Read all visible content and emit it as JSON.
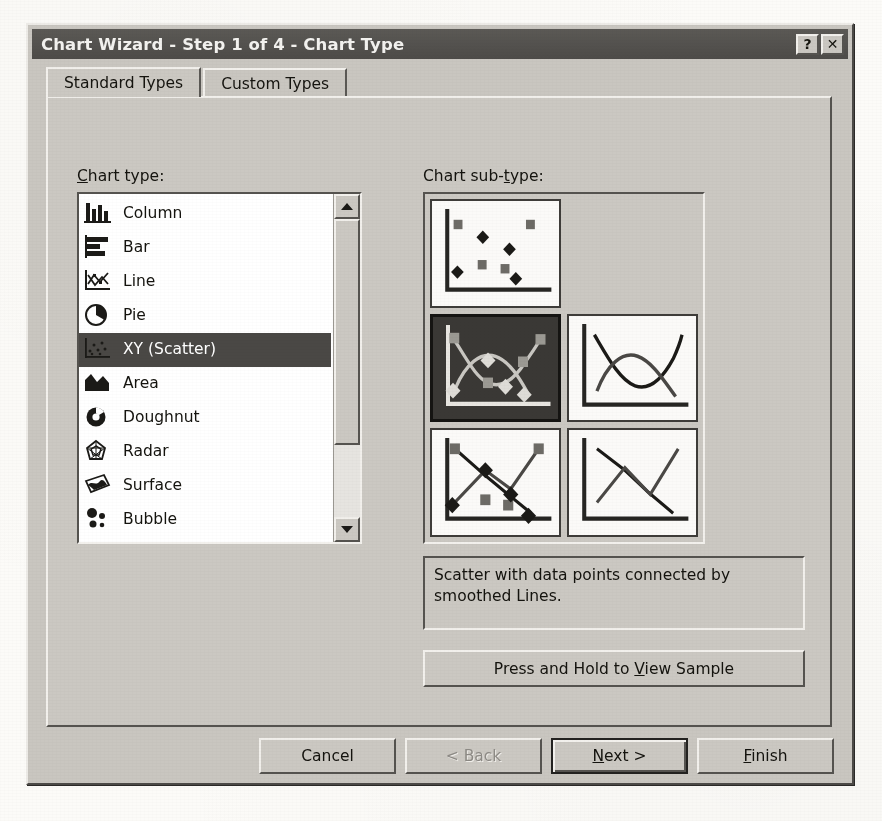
{
  "window": {
    "title": "Chart Wizard - Step 1 of 4 - Chart Type",
    "help_button": "?",
    "close_button": "✕"
  },
  "tabs": [
    {
      "label": "Standard Types",
      "active": true
    },
    {
      "label": "Custom Types",
      "active": false
    }
  ],
  "chart_type": {
    "label": "Chart type:",
    "label_accel": "C",
    "items": [
      {
        "label": "Column",
        "icon": "column-chart-icon",
        "selected": false
      },
      {
        "label": "Bar",
        "icon": "bar-chart-icon",
        "selected": false
      },
      {
        "label": "Line",
        "icon": "line-chart-icon",
        "selected": false
      },
      {
        "label": "Pie",
        "icon": "pie-chart-icon",
        "selected": false
      },
      {
        "label": "XY (Scatter)",
        "icon": "scatter-chart-icon",
        "selected": true
      },
      {
        "label": "Area",
        "icon": "area-chart-icon",
        "selected": false
      },
      {
        "label": "Doughnut",
        "icon": "doughnut-chart-icon",
        "selected": false
      },
      {
        "label": "Radar",
        "icon": "radar-chart-icon",
        "selected": false
      },
      {
        "label": "Surface",
        "icon": "surface-chart-icon",
        "selected": false
      },
      {
        "label": "Bubble",
        "icon": "bubble-chart-icon",
        "selected": false
      }
    ],
    "scrollbar": {
      "up_arrow": "scroll-up-icon",
      "down_arrow": "scroll-down-icon"
    }
  },
  "chart_subtype": {
    "label": "Chart sub-type:",
    "label_accel": "t",
    "items": [
      {
        "name": "scatter-markers-only",
        "selected": false
      },
      {
        "name": "scatter-smoothed-lines-markers",
        "selected": true
      },
      {
        "name": "scatter-smoothed-lines",
        "selected": false
      },
      {
        "name": "scatter-straight-lines-markers",
        "selected": false
      },
      {
        "name": "scatter-straight-lines",
        "selected": false
      }
    ],
    "description": "Scatter with data points connected by smoothed Lines."
  },
  "sample_button": {
    "label": "Press and Hold to View Sample",
    "accel": "V"
  },
  "footer_buttons": [
    {
      "label": "Cancel",
      "state": "enabled"
    },
    {
      "label": "< Back",
      "state": "disabled"
    },
    {
      "label": "Next >",
      "state": "default",
      "accel": "N"
    },
    {
      "label": "Finish",
      "state": "enabled",
      "accel": "F"
    }
  ],
  "colors": {
    "dialog_face": "#c9c6c0",
    "titlebar": "#4d4b48",
    "selection": "#4a4845",
    "list_background": "#ffffff",
    "text": "#14130e"
  }
}
